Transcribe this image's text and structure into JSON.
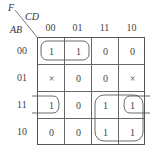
{
  "title": {
    "function": "F",
    "col_vars": "CD",
    "row_vars": "AB"
  },
  "col_headers": [
    "00",
    "01",
    "11",
    "10"
  ],
  "row_headers": [
    "00",
    "01",
    "11",
    "10"
  ],
  "cells": [
    [
      "1",
      "1",
      "0",
      "0"
    ],
    [
      "×",
      "0",
      "0",
      "×"
    ],
    [
      "1",
      "0",
      "1",
      "1"
    ],
    [
      "1",
      "0",
      "1",
      "1"
    ]
  ],
  "cells_display": [
    [
      "1",
      "1",
      "0",
      "0"
    ],
    [
      "×",
      "0",
      "0",
      "×"
    ],
    [
      "1",
      "0",
      "1",
      "1"
    ],
    [
      "0",
      "0",
      "1",
      "1"
    ]
  ],
  "groups": [
    {
      "name": "row00-cols00-01",
      "cells": [
        [
          0,
          0
        ],
        [
          0,
          1
        ]
      ]
    },
    {
      "name": "row11-wrap-cols00-10",
      "cells": [
        [
          2,
          0
        ],
        [
          2,
          3
        ]
      ]
    },
    {
      "name": "rows11-10-cols11-10",
      "cells": [
        [
          2,
          2
        ],
        [
          2,
          3
        ],
        [
          3,
          2
        ],
        [
          3,
          3
        ]
      ]
    }
  ]
}
